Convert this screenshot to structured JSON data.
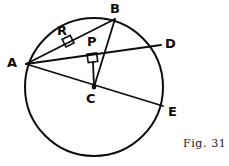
{
  "figure": {
    "caption": "Fig. 31",
    "ink_color": "#0d0d0d",
    "background_color": "#ffffff",
    "circle": {
      "cx": 94,
      "cy": 87,
      "r": 69
    },
    "points": {
      "A": {
        "x": 26,
        "y": 64,
        "label": "A",
        "label_x": 7,
        "label_y": 56
      },
      "B": {
        "x": 115,
        "y": 19,
        "label": "B",
        "label_x": 110,
        "label_y": 2
      },
      "C": {
        "x": 94,
        "y": 87,
        "label": "C",
        "label_x": 86,
        "label_y": 92
      },
      "D": {
        "x": 161,
        "y": 45,
        "label": "D",
        "label_x": 165,
        "label_y": 37
      },
      "E": {
        "x": 163,
        "y": 106,
        "label": "E",
        "label_x": 168,
        "label_y": 105
      },
      "P": {
        "x": 93,
        "y": 62,
        "label": "P",
        "label_x": 87,
        "label_y": 35
      },
      "R": {
        "x": 70,
        "y": 45,
        "label": "R",
        "label_x": 57,
        "label_y": 24
      }
    },
    "segments": [
      {
        "name": "chord-ab",
        "from": "A",
        "to": "B"
      },
      {
        "name": "chord-ad",
        "from": "A",
        "to": "D"
      },
      {
        "name": "chord-ae",
        "from": "A",
        "to": "E"
      },
      {
        "name": "radius-cb",
        "from": "C",
        "to": "B"
      },
      {
        "name": "perpendicular-cp",
        "from": "C",
        "to": "P"
      }
    ],
    "right_angles": [
      {
        "name": "right-angle-at-r",
        "x": 70,
        "y": 45
      },
      {
        "name": "right-angle-at-p",
        "x": 93,
        "y": 62
      }
    ]
  }
}
